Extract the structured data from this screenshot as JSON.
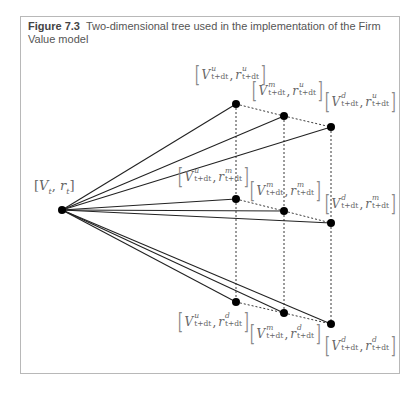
{
  "caption": {
    "figure_label": "Figure 7.3",
    "text": "Two-dimensional tree used in the implementation of the Firm Value model"
  },
  "root": {
    "label_v": "V",
    "label_v_sub": "t",
    "label_r": "r",
    "label_r_sub": "t",
    "x": 62,
    "y": 210
  },
  "step_subscript": "t+dt",
  "nodes": [
    {
      "id": "uu",
      "v_sup": "u",
      "r_sup": "u",
      "x": 236,
      "y": 104,
      "lx": 193,
      "ly": 64
    },
    {
      "id": "mu",
      "v_sup": "m",
      "r_sup": "u",
      "x": 284,
      "y": 116,
      "lx": 250,
      "ly": 80
    },
    {
      "id": "du",
      "v_sup": "d",
      "r_sup": "u",
      "x": 331,
      "y": 127,
      "lx": 323,
      "ly": 91
    },
    {
      "id": "um",
      "v_sup": "u",
      "r_sup": "m",
      "x": 236,
      "y": 199,
      "lx": 176,
      "ly": 166
    },
    {
      "id": "mm",
      "v_sup": "m",
      "r_sup": "m",
      "x": 284,
      "y": 211,
      "lx": 248,
      "ly": 180
    },
    {
      "id": "dm",
      "v_sup": "d",
      "r_sup": "m",
      "x": 331,
      "y": 223,
      "lx": 323,
      "ly": 193
    },
    {
      "id": "ud",
      "v_sup": "u",
      "r_sup": "d",
      "x": 236,
      "y": 302,
      "lx": 176,
      "ly": 311
    },
    {
      "id": "md",
      "v_sup": "m",
      "r_sup": "d",
      "x": 284,
      "y": 313,
      "lx": 248,
      "ly": 323
    },
    {
      "id": "dd",
      "v_sup": "d",
      "r_sup": "d",
      "x": 331,
      "y": 324,
      "lx": 323,
      "ly": 335
    }
  ],
  "colors": {
    "line": "#222222",
    "node": "#000000",
    "frame": "#b8b8b8",
    "text": "#555555"
  }
}
